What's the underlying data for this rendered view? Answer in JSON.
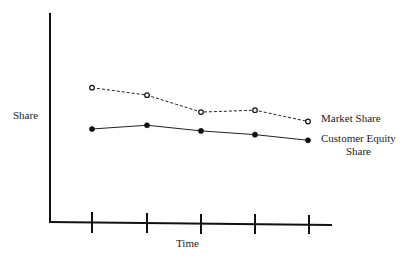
{
  "chart_data": {
    "type": "line",
    "title": "",
    "xlabel": "Time",
    "ylabel": "Share",
    "categories": [
      "t1",
      "t2",
      "t3",
      "t4",
      "t5"
    ],
    "x_ticks_labeled": false,
    "y_ticks": false,
    "grid": false,
    "series": [
      {
        "name": "Market Share",
        "style": "dashed, open circles",
        "values": [
          0.72,
          0.68,
          0.59,
          0.6,
          0.54
        ]
      },
      {
        "name": "Customer Equity Share",
        "style": "solid, filled circles",
        "values": [
          0.5,
          0.52,
          0.49,
          0.47,
          0.44
        ]
      }
    ],
    "legend": "inline labels at right end of each line"
  },
  "labels": {
    "ylabel": "Share",
    "xlabel": "Time",
    "series1": "Market Share",
    "series2_line1": "Customer Equity",
    "series2_line2": "Share"
  }
}
